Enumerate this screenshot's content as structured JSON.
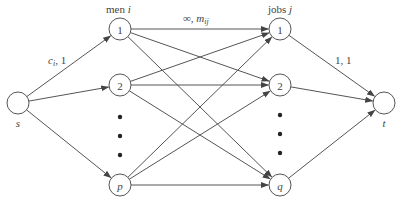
{
  "diagram": {
    "type": "bipartite-flow-network",
    "labels": {
      "men_header": "men i",
      "jobs_header": "jobs j",
      "source_edge_label": "c_i, 1",
      "middle_edge_label": "∞, m_ij",
      "sink_edge_label": "1, 1"
    },
    "nodes": [
      {
        "id": "s",
        "label": "s",
        "x": 18,
        "y": 103,
        "label_pos": "below"
      },
      {
        "id": "m1",
        "label": "1",
        "x": 120,
        "y": 29
      },
      {
        "id": "m2",
        "label": "2",
        "x": 120,
        "y": 85
      },
      {
        "id": "mp",
        "label": "p",
        "x": 120,
        "y": 185
      },
      {
        "id": "j1",
        "label": "1",
        "x": 280,
        "y": 29
      },
      {
        "id": "j2",
        "label": "2",
        "x": 280,
        "y": 85
      },
      {
        "id": "jq",
        "label": "q",
        "x": 280,
        "y": 185
      },
      {
        "id": "t",
        "label": "t",
        "x": 384,
        "y": 103,
        "label_pos": "below"
      }
    ],
    "edges": [
      {
        "from": "s",
        "to": "m1"
      },
      {
        "from": "s",
        "to": "m2"
      },
      {
        "from": "s",
        "to": "mp"
      },
      {
        "from": "m1",
        "to": "j1"
      },
      {
        "from": "m1",
        "to": "j2"
      },
      {
        "from": "m1",
        "to": "jq"
      },
      {
        "from": "m2",
        "to": "j1"
      },
      {
        "from": "m2",
        "to": "j2"
      },
      {
        "from": "m2",
        "to": "jq"
      },
      {
        "from": "mp",
        "to": "j1"
      },
      {
        "from": "mp",
        "to": "j2"
      },
      {
        "from": "mp",
        "to": "jq"
      },
      {
        "from": "j1",
        "to": "t"
      },
      {
        "from": "j2",
        "to": "t"
      },
      {
        "from": "jq",
        "to": "t"
      }
    ],
    "ellipsis_dots": [
      {
        "column": "men",
        "x": 120,
        "ys": [
          117,
          136,
          155
        ]
      },
      {
        "column": "jobs",
        "x": 280,
        "ys": [
          115,
          134,
          153
        ]
      }
    ],
    "colors": {
      "stroke": "#555555",
      "text": "#444444",
      "dot": "#222222",
      "background": "#ffffff"
    }
  }
}
